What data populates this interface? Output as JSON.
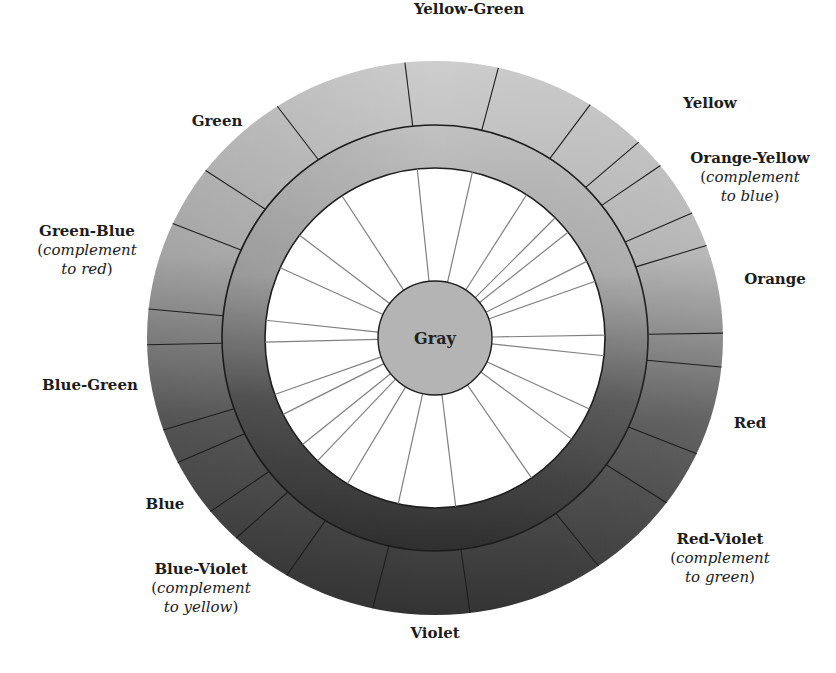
{
  "diagram": {
    "type": "color-wheel",
    "center": {
      "x": 435,
      "y": 338
    },
    "outer_ring": {
      "rx": 288,
      "ry": 277,
      "inner_r": 213
    },
    "inner_ring": {
      "r": 213,
      "inner_r": 170
    },
    "spoke_disk": {
      "r": 170,
      "fill": "#ffffff"
    },
    "center_disk": {
      "r": 57,
      "fill": "#b4b4b4",
      "label": "Gray"
    },
    "divider_angles_deg": [
      -96,
      -77.3,
      -57.4,
      -45,
      -38.5,
      -26.8,
      -19.5,
      -1,
      6,
      24.7,
      36.5,
      55.4,
      83,
      102.5,
      121,
      133.7,
      141.2,
      153.3,
      160.6,
      178.6,
      186,
      204.4,
      217.2,
      236.8
    ],
    "shading": {
      "top": "#cdcdcd",
      "upper_right": "#b5b5b5",
      "right": "#7e7e7e",
      "lower_right": "#626262",
      "bottom": "#333333",
      "lower_left": "#4a4a4a",
      "left": "#5c5c5c",
      "upper_left": "#8e8e8e"
    },
    "line_color": "#1e1e1e",
    "spoke_color": "#808080"
  },
  "labels": [
    {
      "id": "yellow-green",
      "name": "Yellow-Green",
      "note": "",
      "x": 384,
      "y": 0,
      "w": 170
    },
    {
      "id": "yellow",
      "name": "Yellow",
      "note": "",
      "x": 660,
      "y": 94,
      "w": 100
    },
    {
      "id": "orange-yellow",
      "name": "Orange-Yellow",
      "note_a": "complement",
      "note_b": "to blue",
      "x": 665,
      "y": 149,
      "w": 170
    },
    {
      "id": "orange",
      "name": "Orange",
      "note": "",
      "x": 725,
      "y": 270,
      "w": 100
    },
    {
      "id": "red",
      "name": "Red",
      "note": "",
      "x": 720,
      "y": 414,
      "w": 60
    },
    {
      "id": "red-violet",
      "name": "Red-Violet",
      "note_a": "complement",
      "note_b": "to green",
      "x": 655,
      "y": 530,
      "w": 130
    },
    {
      "id": "violet",
      "name": "Violet",
      "note": "",
      "x": 380,
      "y": 624,
      "w": 110
    },
    {
      "id": "blue-violet",
      "name": "Blue-Violet",
      "note_a": "complement",
      "note_b": "to yellow",
      "x": 136,
      "y": 560,
      "w": 130
    },
    {
      "id": "blue",
      "name": "Blue",
      "note": "",
      "x": 135,
      "y": 495,
      "w": 60
    },
    {
      "id": "blue-green",
      "name": "Blue-Green",
      "note": "",
      "x": 30,
      "y": 376,
      "w": 120
    },
    {
      "id": "green-blue",
      "name": "Green-Blue",
      "note_a": "complement",
      "note_b": "to red",
      "x": 22,
      "y": 222,
      "w": 130
    },
    {
      "id": "green",
      "name": "Green",
      "note": "",
      "x": 172,
      "y": 112,
      "w": 90
    }
  ]
}
